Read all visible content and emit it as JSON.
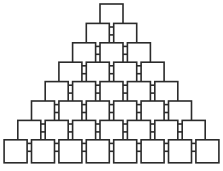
{
  "diagram": {
    "type": "node-pyramid",
    "shape_name": "square",
    "row_count": 8,
    "total_nodes": 36,
    "rows": [
      {
        "index": 1,
        "node_count": 1
      },
      {
        "index": 2,
        "node_count": 2
      },
      {
        "index": 3,
        "node_count": 3
      },
      {
        "index": 4,
        "node_count": 4
      },
      {
        "index": 5,
        "node_count": 5
      },
      {
        "index": 6,
        "node_count": 6
      },
      {
        "index": 7,
        "node_count": 7
      },
      {
        "index": 8,
        "node_count": 8
      }
    ],
    "geometry": {
      "canvas_width": 223,
      "canvas_height": 171,
      "square_size": 23,
      "horizontal_pitch": 27.4,
      "vertical_pitch": 19.4,
      "top_row_y": 4,
      "bottom_row_left_x": 4,
      "connector_horizontal_length": 4.4,
      "connector_vertical_length": 4
    },
    "colors": {
      "background": "#ffffff",
      "stroke": "#2b2b2b",
      "fill": "#ffffff"
    }
  }
}
